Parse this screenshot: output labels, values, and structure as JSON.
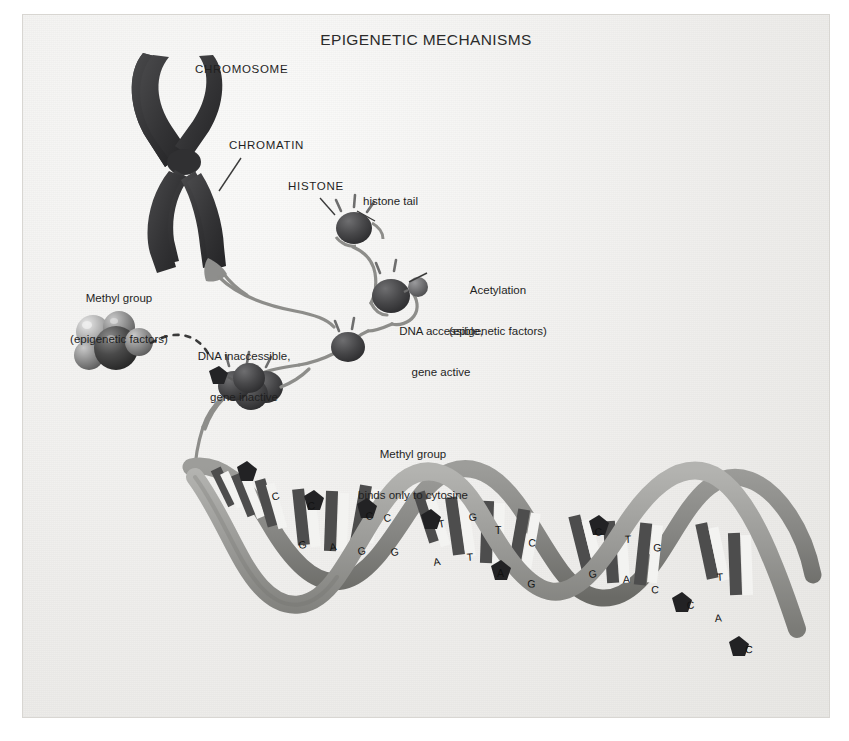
{
  "figure": {
    "title": "EPIGENETIC MECHANISMS",
    "background_color": "#f2f1ef",
    "ink_color": "#1f1f1f"
  },
  "labels": {
    "chromosome": "CHROMOSOME",
    "chromatin": "CHROMATIN",
    "histone": "HISTONE",
    "histone_tail": "histone tail",
    "acetylation_line1": "Acetylation",
    "acetylation_line2": "(epigenetic factors)",
    "dna_accessible_line1": "DNA accessible,",
    "dna_accessible_line2": "gene active",
    "methyl_group_line1": "Methyl group",
    "methyl_group_line2": "(epigenetic factors)",
    "dna_inaccessible_line1": "DNA inaccessible,",
    "dna_inaccessible_line2": "gene inactive",
    "methyl_cytosine_line1": "Methyl group",
    "methyl_cytosine_line2": "binds only to cytosine"
  },
  "diagram": {
    "chromosome_color": "#38383a",
    "chromatin_fiber_color": "#8d8d8d",
    "histone_color": "#4a4a4c",
    "acetyl_color": "#6f6f71",
    "methyl_marker_color": "#2a2a2c",
    "dna_backbone_color": "#9a9a98",
    "dna_backbone_shadow": "#74746f",
    "base_rung_dark": "#4d4d4d",
    "base_rung_light": "#f5f5f3",
    "methyl_sphere_colors": [
      "#b9b9b9",
      "#8c8c8c",
      "#3d3d3d",
      "#6a6a6a"
    ]
  },
  "dna": {
    "base_letters": [
      "C",
      "G",
      "A",
      "T",
      "C",
      "G",
      "C",
      "A",
      "T",
      "G",
      "C",
      "A",
      "T",
      "G",
      "C",
      "T",
      "A",
      "G",
      "C",
      "A",
      "T",
      "C",
      "G",
      "T",
      "A",
      "C"
    ],
    "methylated_base": "C",
    "methyl_marker_count": 8
  }
}
